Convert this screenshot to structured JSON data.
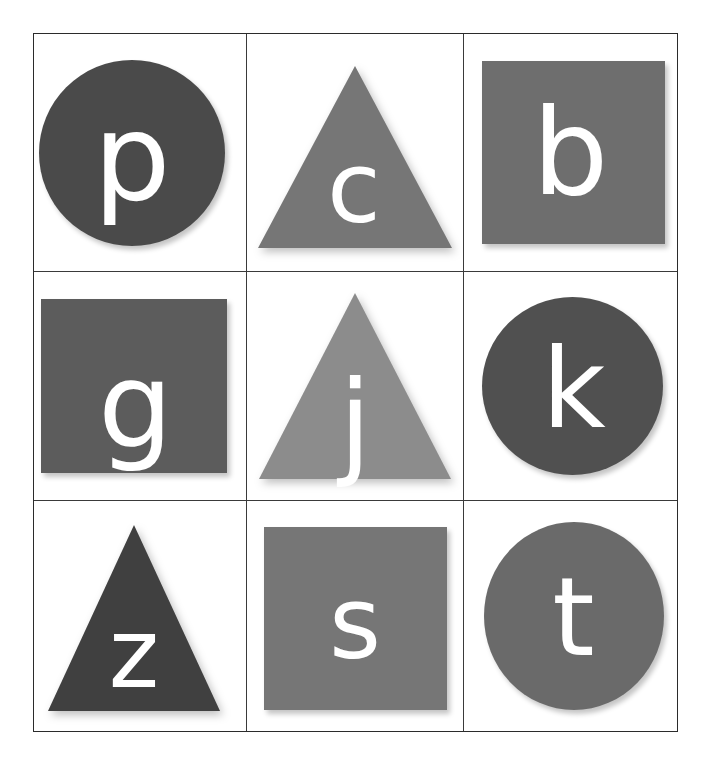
{
  "page": {
    "background_color": "#ffffff",
    "border_color": "#2b2b2b",
    "grid_line_color": "#3a3a3a",
    "letter_color": "#ffffff",
    "rows": 3,
    "columns": 3
  },
  "cells": [
    {
      "index": 1,
      "letter": "p",
      "shape": "circle",
      "shape_name": "circle-shape",
      "color": "#4a4a4a",
      "row": 1,
      "column": 1
    },
    {
      "index": 2,
      "letter": "c",
      "shape": "triangle",
      "shape_name": "triangle-shape",
      "color": "#767676",
      "row": 1,
      "column": 2
    },
    {
      "index": 3,
      "letter": "b",
      "shape": "square",
      "shape_name": "square-shape",
      "color": "#6e6e6e",
      "row": 1,
      "column": 3
    },
    {
      "index": 4,
      "letter": "g",
      "shape": "square",
      "shape_name": "square-shape",
      "color": "#5c5c5c",
      "row": 2,
      "column": 1
    },
    {
      "index": 5,
      "letter": "j",
      "shape": "triangle",
      "shape_name": "triangle-shape",
      "color": "#8c8c8c",
      "row": 2,
      "column": 2
    },
    {
      "index": 6,
      "letter": "k",
      "shape": "circle",
      "shape_name": "circle-shape",
      "color": "#505050",
      "row": 2,
      "column": 3
    },
    {
      "index": 7,
      "letter": "z",
      "shape": "triangle",
      "shape_name": "triangle-shape",
      "color": "#404040",
      "row": 3,
      "column": 1
    },
    {
      "index": 8,
      "letter": "s",
      "shape": "square",
      "shape_name": "square-shape",
      "color": "#767676",
      "row": 3,
      "column": 2
    },
    {
      "index": 9,
      "letter": "t",
      "shape": "circle",
      "shape_name": "circle-shape",
      "color": "#6a6a6a",
      "row": 3,
      "column": 3
    }
  ]
}
